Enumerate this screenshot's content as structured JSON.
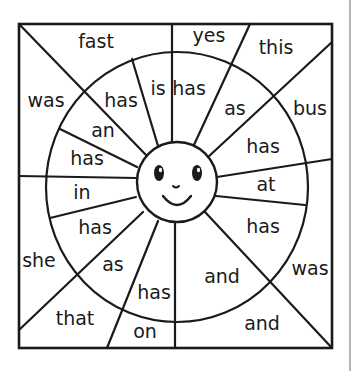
{
  "worksheet": {
    "description": "Word color-by-word puzzle with smiling sun face in the center",
    "center_icon": "smiling-sun-face-icon",
    "line_color": "#1a1a1a",
    "background_color": "#ffffff",
    "outer_ring_words": [
      {
        "id": "fast",
        "text": "fast"
      },
      {
        "id": "yes",
        "text": "yes"
      },
      {
        "id": "this",
        "text": "this"
      },
      {
        "id": "bus",
        "text": "bus"
      },
      {
        "id": "was_right",
        "text": "was"
      },
      {
        "id": "and_bottom_right",
        "text": "and"
      },
      {
        "id": "on",
        "text": "on"
      },
      {
        "id": "that",
        "text": "that"
      },
      {
        "id": "she",
        "text": "she"
      },
      {
        "id": "was_left",
        "text": "was"
      }
    ],
    "inner_ring_words": [
      {
        "id": "is",
        "text": "is"
      },
      {
        "id": "has_top",
        "text": "has"
      },
      {
        "id": "as_upper_right",
        "text": "as"
      },
      {
        "id": "has_upper_right",
        "text": "has"
      },
      {
        "id": "at",
        "text": "at"
      },
      {
        "id": "has_right",
        "text": "has"
      },
      {
        "id": "and_inner",
        "text": "and"
      },
      {
        "id": "has_bottom",
        "text": "has"
      },
      {
        "id": "as_lower_left",
        "text": "as"
      },
      {
        "id": "has_lower_left",
        "text": "has"
      },
      {
        "id": "in",
        "text": "in"
      },
      {
        "id": "has_left",
        "text": "has"
      },
      {
        "id": "an",
        "text": "an"
      },
      {
        "id": "has_upper_left",
        "text": "has"
      }
    ]
  }
}
